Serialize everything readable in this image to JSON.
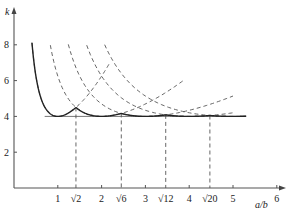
{
  "chart_data": {
    "type": "line",
    "title": "",
    "xlabel": "a/b",
    "ylabel": "k",
    "xlim": [
      0,
      6.3
    ],
    "ylim": [
      0,
      9
    ],
    "grid": false,
    "formula": "k = (m*b/a + a/(m*b))^2",
    "x_ticks": [
      {
        "value": 1,
        "label": "1"
      },
      {
        "value": 2,
        "label": "2"
      },
      {
        "value": 3,
        "label": "3"
      },
      {
        "value": 4,
        "label": "4"
      },
      {
        "value": 5,
        "label": "5"
      },
      {
        "value": 6,
        "label": "6"
      }
    ],
    "x_special_ticks": [
      {
        "value": 1.41421,
        "label": "√2"
      },
      {
        "value": 2.44949,
        "label": "√6"
      },
      {
        "value": 3.4641,
        "label": "√12"
      },
      {
        "value": 4.47214,
        "label": "√20"
      }
    ],
    "y_ticks": [
      {
        "value": 2,
        "label": "2"
      },
      {
        "value": 4,
        "label": "4"
      },
      {
        "value": 6,
        "label": "6"
      },
      {
        "value": 8,
        "label": "8"
      }
    ],
    "reference_line": {
      "k": 4,
      "x_range": [
        0.7,
        5.3
      ]
    },
    "series": [
      {
        "name": "m=1",
        "m": 1,
        "style": "dashed",
        "x_range": [
          0.41,
          2.2
        ]
      },
      {
        "name": "m=2",
        "m": 2,
        "style": "dashed",
        "x_range": [
          0.83,
          3.9
        ]
      },
      {
        "name": "m=3",
        "m": 3,
        "style": "dashed",
        "x_range": [
          1.24,
          5.0
        ]
      },
      {
        "name": "m=4",
        "m": 4,
        "style": "dashed",
        "x_range": [
          1.66,
          5.0
        ]
      },
      {
        "name": "m=5",
        "m": 5,
        "style": "dashed",
        "x_range": [
          2.07,
          5.3
        ]
      }
    ],
    "envelope": {
      "name": "envelope",
      "style": "solid",
      "x_range": [
        0.41,
        5.3
      ],
      "m_max": 5
    }
  }
}
